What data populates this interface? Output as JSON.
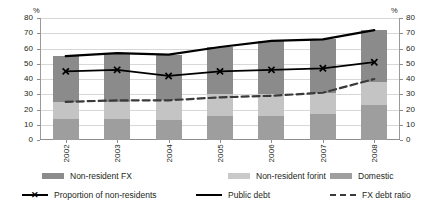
{
  "chart_data": {
    "type": "bar",
    "title": "",
    "subtitle": "",
    "xlabel": "",
    "ylabel": "%",
    "ylabel_right": "%",
    "ylim": [
      0,
      80
    ],
    "yticks": [
      0,
      10,
      20,
      30,
      40,
      50,
      60,
      70,
      80
    ],
    "grid": true,
    "legend_position": "bottom",
    "stacked": true,
    "categories": [
      "2002",
      "2003",
      "2004",
      "2005",
      "2006",
      "2007",
      "2008"
    ],
    "series": [
      {
        "name": "Domestic",
        "type": "bar",
        "values": [
          14,
          14,
          13,
          16,
          16,
          17,
          23
        ]
      },
      {
        "name": "Non-resident forint",
        "type": "bar",
        "values": [
          11,
          11,
          13,
          14,
          14,
          14,
          15
        ]
      },
      {
        "name": "Non-resident FX",
        "type": "bar",
        "values": [
          30,
          32,
          30,
          31,
          35,
          35,
          34
        ]
      },
      {
        "name": "Public debt",
        "type": "line",
        "values": [
          55,
          57,
          56,
          61,
          65,
          66,
          72
        ]
      },
      {
        "name": "Proportion of non-residents",
        "type": "line",
        "values": [
          45,
          46,
          42,
          45,
          46,
          47,
          51
        ]
      },
      {
        "name": "FX debt ratio",
        "type": "line",
        "values": [
          25,
          26,
          26,
          28,
          29,
          31,
          40
        ]
      }
    ]
  },
  "axes": {
    "unit_left": "%",
    "unit_right": "%",
    "tick_labels": [
      "0",
      "10",
      "20",
      "30",
      "40",
      "50",
      "60",
      "70",
      "80"
    ],
    "category_labels": [
      "2002",
      "2003",
      "2004",
      "2005",
      "2006",
      "2007",
      "2008"
    ]
  },
  "legend": {
    "row1": [
      {
        "label": "Non-resident FX",
        "marker": "swatch",
        "color": "#8b8b8b"
      },
      {
        "label": "Non-resident forint",
        "marker": "swatch",
        "color": "#c9c9c9"
      },
      {
        "label": "Domestic",
        "marker": "swatch",
        "color": "#9e9e9e"
      }
    ],
    "row2": [
      {
        "label": "Proportion of non-residents",
        "marker": "line-x",
        "color": "#000000"
      },
      {
        "label": "Public debt",
        "marker": "line",
        "color": "#000000"
      },
      {
        "label": "FX debt ratio",
        "marker": "line-dash",
        "color": "#3a3a3a"
      }
    ]
  }
}
